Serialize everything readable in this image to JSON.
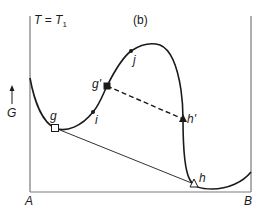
{
  "diagram": {
    "panel_label": "(b)",
    "condition": {
      "symbol": "T",
      "eq": "=",
      "value": "T",
      "subscript": "1"
    },
    "y_axis": {
      "label": "G",
      "arrow": "up-arrow"
    },
    "x_axis": {
      "left_label": "A",
      "right_label": "B"
    },
    "points": {
      "g": "g",
      "g_prime": "g'",
      "i": "i",
      "j": "j",
      "h_prime": "h'",
      "h": "h"
    },
    "colors": {
      "line": "#1a1a1a",
      "frame": "#7a7a7a",
      "background": "#ffffff"
    }
  }
}
